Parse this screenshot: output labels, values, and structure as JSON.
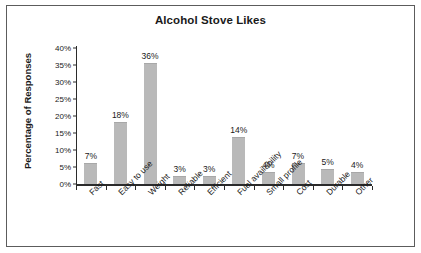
{
  "chart_data": {
    "type": "bar",
    "title": "Alcohol Stove Likes",
    "xlabel": "",
    "ylabel": "Percentage of Responses",
    "ylim": [
      0,
      40
    ],
    "ytick_labels": [
      "0%",
      "5%",
      "10%",
      "15%",
      "20%",
      "25%",
      "30%",
      "35%",
      "40%"
    ],
    "ytick_values": [
      0,
      5,
      10,
      15,
      20,
      25,
      30,
      35,
      40
    ],
    "grid": false,
    "legend": "none",
    "bar_color": "#b9b9b9",
    "axis_color": "#2b2b2b",
    "frame_color": "#5c5c5c",
    "categories": [
      "Fast",
      "Easy to use",
      "Weight",
      "Reliable",
      "Efficient",
      "Fuel availability",
      "Small profile",
      "Cost",
      "Durable",
      "Other"
    ],
    "values": [
      7,
      18,
      36,
      3,
      3,
      14,
      4,
      7,
      5,
      4
    ],
    "drawn_values": [
      6.3,
      18.3,
      35.5,
      2.4,
      2.4,
      13.8,
      3.6,
      6.1,
      4.4,
      3.4
    ],
    "data_labels": [
      "7%",
      "18%",
      "36%",
      "3%",
      "3%",
      "14%",
      "4%",
      "7%",
      "5%",
      "4%"
    ]
  }
}
